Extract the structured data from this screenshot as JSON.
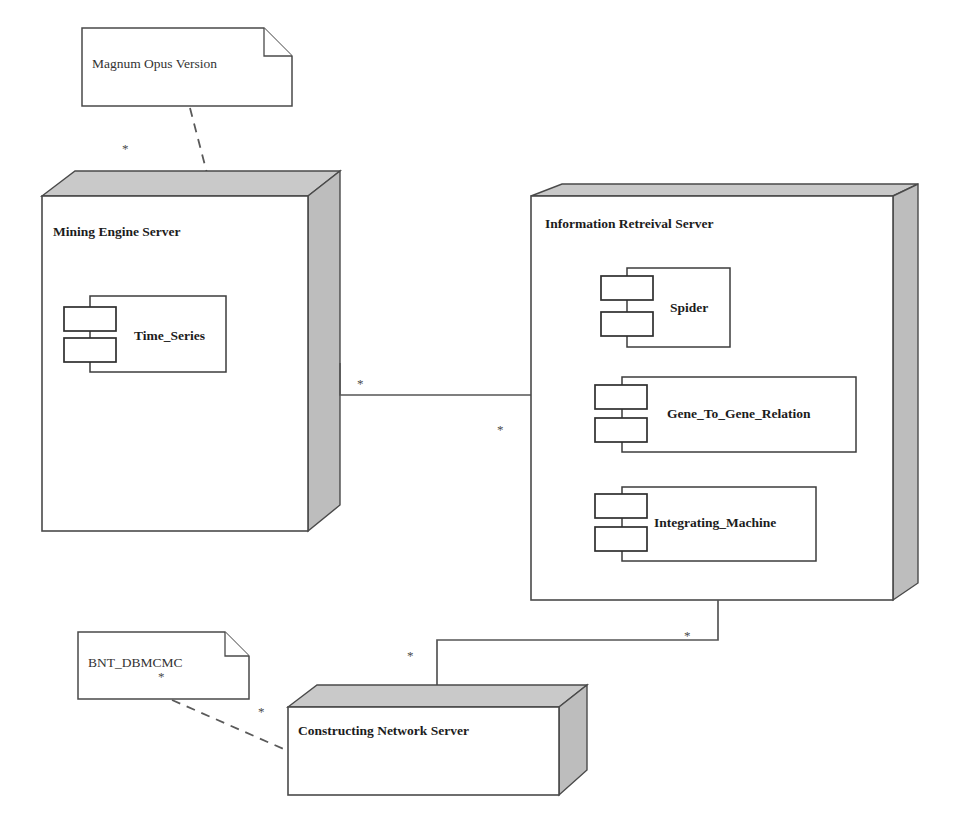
{
  "diagram": {
    "type": "uml-deployment-diagram",
    "background_color": "#ffffff",
    "line_color": "#565656",
    "node_face_color": "#ffffff",
    "node_shade_color": "#c9c9c9"
  },
  "notes": [
    {
      "id": "note-magnum-opus",
      "text": "Magnum Opus Version"
    },
    {
      "id": "note-bnt-dbmcmc",
      "text": "BNT_DBMCMC"
    }
  ],
  "nodes": [
    {
      "id": "node-mining-engine-server",
      "label": "Mining Engine Server",
      "components": [
        {
          "id": "component-time-series",
          "label": "Time_Series"
        }
      ]
    },
    {
      "id": "node-information-retreival-server",
      "label": "Information Retreival Server",
      "components": [
        {
          "id": "component-spider",
          "label": "Spider"
        },
        {
          "id": "component-gene-to-gene-relation",
          "label": "Gene_To_Gene_Relation"
        },
        {
          "id": "component-integrating-machine",
          "label": "Integrating_Machine"
        }
      ]
    },
    {
      "id": "node-constructing-network-server",
      "label": "Constructing Network Server",
      "components": []
    }
  ],
  "connections": [
    {
      "id": "assoc-mining-to-retreival",
      "kind": "association",
      "from": "node-mining-engine-server",
      "to": "node-information-retreival-server",
      "source_multiplicity": "*",
      "target_multiplicity": "*"
    },
    {
      "id": "assoc-retreival-to-constructing",
      "kind": "association",
      "from": "node-information-retreival-server",
      "to": "node-constructing-network-server",
      "source_multiplicity": "*",
      "target_multiplicity": "*"
    },
    {
      "id": "dep-magnum-opus-to-mining",
      "kind": "dependency",
      "from": "note-magnum-opus",
      "to": "node-mining-engine-server",
      "source_multiplicity": "",
      "target_multiplicity": "*"
    },
    {
      "id": "dep-bnt-to-constructing",
      "kind": "dependency",
      "from": "note-bnt-dbmcmc",
      "to": "node-constructing-network-server",
      "source_multiplicity": "*",
      "target_multiplicity": "*"
    }
  ],
  "multiplicity_markers": {
    "m1": "*",
    "m2": "*",
    "m3": "*",
    "m4": "*",
    "m5": "*",
    "m6": "*"
  }
}
